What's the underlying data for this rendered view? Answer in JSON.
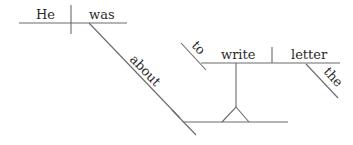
{
  "diagram": {
    "type": "sentence-diagram (Reed-Kellogg)",
    "words": {
      "subject": "He",
      "verb": "was",
      "preposition": "about",
      "infinitive_marker": "to",
      "infinitive_verb": "write",
      "direct_object": "letter",
      "article": "the"
    },
    "colors": {
      "line": "#6a6a6a",
      "text": "#2a2a2a",
      "background": "#ffffff"
    }
  }
}
